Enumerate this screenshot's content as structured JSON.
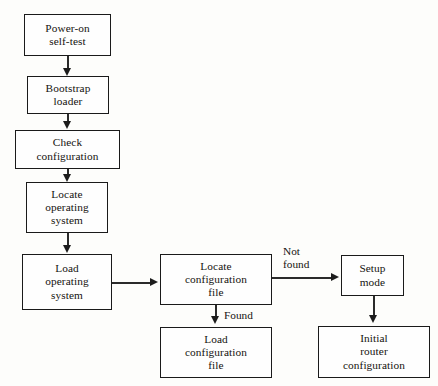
{
  "diagram": {
    "background_color": "#fdfdfb",
    "line_color": "#1a1a1a",
    "text_color": "#15130f",
    "nodes": [
      {
        "id": "power-on-self-test",
        "label": "Power-on\nself-test",
        "x": 24,
        "y": 14,
        "w": 87,
        "h": 42
      },
      {
        "id": "bootstrap-loader",
        "label": "Bootstrap\nloader",
        "x": 27,
        "y": 76,
        "w": 82,
        "h": 38
      },
      {
        "id": "check-configuration",
        "label": "Check\nconfiguration",
        "x": 15,
        "y": 130,
        "w": 105,
        "h": 39
      },
      {
        "id": "locate-operating-system",
        "label": "Locate\noperating\nsystem",
        "x": 26,
        "y": 182,
        "w": 82,
        "h": 51
      },
      {
        "id": "load-operating-system",
        "label": "Load\noperating\nsystem",
        "x": 22,
        "y": 254,
        "w": 90,
        "h": 56
      },
      {
        "id": "locate-configuration-file",
        "label": "Locate\nconfiguration\nfile",
        "x": 160,
        "y": 254,
        "w": 112,
        "h": 51
      },
      {
        "id": "load-configuration-file",
        "label": "Load\nconfiguration\nfile",
        "x": 160,
        "y": 327,
        "w": 112,
        "h": 51
      },
      {
        "id": "setup-mode",
        "label": "Setup\nmode",
        "x": 341,
        "y": 255,
        "w": 63,
        "h": 41
      },
      {
        "id": "initial-router-configuration",
        "label": "Initial\nrouter\nconfiguration",
        "x": 318,
        "y": 326,
        "w": 112,
        "h": 52
      }
    ],
    "edge_labels": [
      {
        "id": "not-found",
        "text": "Not\nfound",
        "x": 283,
        "y": 245
      },
      {
        "id": "found",
        "text": "Found",
        "x": 224,
        "y": 309
      }
    ],
    "caption": ""
  }
}
